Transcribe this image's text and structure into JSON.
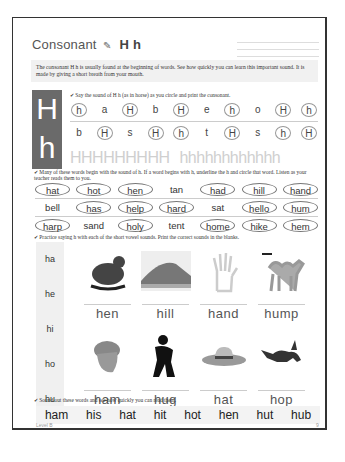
{
  "title": {
    "word": "Consonant",
    "letters": "H  h",
    "pencil_icon": "pencil-icon"
  },
  "intro": "The consonant H h is usually found at the beginning of words. See how quickly you can learn this important sound. It is made by giving a short breath from your mouth.",
  "letterbox": {
    "upper": "H",
    "lower": "h"
  },
  "section1": {
    "instruction": "✔ Say the sound of H h (as in horse) as you circle and print the consonant.",
    "row1": [
      {
        "t": "h",
        "c": true
      },
      {
        "t": "a",
        "c": false
      },
      {
        "t": "H",
        "c": true
      },
      {
        "t": "b",
        "c": false
      },
      {
        "t": "H",
        "c": true
      },
      {
        "t": "e",
        "c": false
      },
      {
        "t": "h",
        "c": true
      },
      {
        "t": "o",
        "c": false
      },
      {
        "t": "H",
        "c": true
      },
      {
        "t": "h",
        "c": true
      }
    ],
    "row2": [
      {
        "t": "b",
        "c": false
      },
      {
        "t": "H",
        "c": true
      },
      {
        "t": "s",
        "c": false
      },
      {
        "t": "H",
        "c": true
      },
      {
        "t": "h",
        "c": true
      },
      {
        "t": "t",
        "c": false
      },
      {
        "t": "H",
        "c": true
      },
      {
        "t": "s",
        "c": false
      },
      {
        "t": "h",
        "c": true
      },
      {
        "t": "H",
        "c": true
      }
    ],
    "trace_upper": "HHHHHHHHH",
    "trace_lower": "hhhhhhhhhhhh"
  },
  "section2": {
    "instruction": "✔ Many of these words begin with the sound of h. If a word begins with h, underline the h and circle that word. Listen as your teacher reads them to you.",
    "rows": [
      [
        {
          "t": "hat",
          "c": true
        },
        {
          "t": "hot",
          "c": true
        },
        {
          "t": "hen",
          "c": true
        },
        {
          "t": "tan",
          "c": false
        },
        {
          "t": "had",
          "c": true
        },
        {
          "t": "hill",
          "c": true
        },
        {
          "t": "hand",
          "c": true
        }
      ],
      [
        {
          "t": "bell",
          "c": false
        },
        {
          "t": "has",
          "c": true
        },
        {
          "t": "help",
          "c": true
        },
        {
          "t": "hard",
          "c": true
        },
        {
          "t": "sat",
          "c": false
        },
        {
          "t": "hello",
          "c": true
        },
        {
          "t": "hum",
          "c": true
        }
      ],
      [
        {
          "t": "harp",
          "c": true
        },
        {
          "t": "sand",
          "c": false
        },
        {
          "t": "holy",
          "c": true
        },
        {
          "t": "tent",
          "c": false
        },
        {
          "t": "home",
          "c": true
        },
        {
          "t": "hike",
          "c": true
        },
        {
          "t": "hem",
          "c": true
        }
      ]
    ]
  },
  "section3": {
    "instruction": "✔ Practice saying h with each of the short vowel sounds. Print the correct sounds in the blanks.",
    "syllables": [
      "ha",
      "he",
      "hi",
      "ho",
      "hu"
    ],
    "pictures": [
      {
        "label": "hen",
        "icon": "hen-icon"
      },
      {
        "label": "hill",
        "icon": "hill-icon"
      },
      {
        "label": "hand",
        "icon": "hand-icon"
      },
      {
        "label": "hump",
        "icon": "camel-icon"
      },
      {
        "label": "ham",
        "icon": "ham-icon"
      },
      {
        "label": "hug",
        "icon": "hug-icon"
      },
      {
        "label": "hat",
        "icon": "hat-icon"
      },
      {
        "label": "hop",
        "icon": "rabbit-icon"
      }
    ]
  },
  "section4": {
    "instruction": "✔ Sound out these words and see how quickly you can read them.",
    "words": [
      "ham",
      "his",
      "hat",
      "hit",
      "hot",
      "hen",
      "hut",
      "hub"
    ]
  },
  "footer": {
    "level": "Level B",
    "page": "9"
  }
}
